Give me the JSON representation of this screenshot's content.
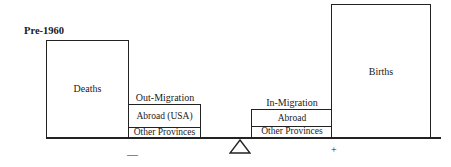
{
  "title": "Pre-1960",
  "outflows": {
    "deaths_label": "Deaths",
    "migration_label": "Out-Migration",
    "components": [
      "Abroad (USA)",
      "Other Provinces"
    ],
    "sign": "—"
  },
  "inflows": {
    "births_label": "Births",
    "migration_label": "In-Migration",
    "components": [
      "Abroad",
      "Other Provinces"
    ],
    "sign": "+"
  },
  "fulcrum_icon": "triangle-fulcrum-icon"
}
